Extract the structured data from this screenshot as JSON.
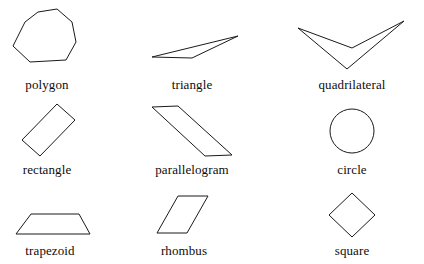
{
  "figure": {
    "background_color": "#ffffff",
    "stroke_color": "#1a1a1a",
    "label_color": "#0d0d0d",
    "rows": 3,
    "columns": 3
  },
  "shapes": [
    {
      "name": "polygon",
      "label": "polygon",
      "type": "heptagon",
      "points": "25,22 38,12 57,9 72,22 76,42 66,60 30,62 13,46",
      "label_x": 47,
      "label_y": 78
    },
    {
      "name": "triangle",
      "label": "triangle",
      "type": "triangle",
      "points": "152,57 238,36 192,58",
      "label_x": 192,
      "label_y": 78
    },
    {
      "name": "quadrilateral",
      "label": "quadrilateral",
      "type": "concave-dart",
      "points": "298,28 352,48 404,21 347,69",
      "label_x": 352,
      "label_y": 78
    },
    {
      "name": "rectangle",
      "label": "rectangle",
      "type": "rectangle",
      "points": "22,140 57,104 75,120 40,156",
      "label_x": 47,
      "label_y": 163
    },
    {
      "name": "parallelogram",
      "label": "parallelogram",
      "type": "parallelogram",
      "points": "152,107 178,106 232,155 205,156",
      "label_x": 192,
      "label_y": 163
    },
    {
      "name": "circle",
      "label": "circle",
      "type": "circle",
      "cx": 352,
      "cy": 131,
      "rx": 22,
      "ry": 22,
      "label_x": 352,
      "label_y": 163
    },
    {
      "name": "trapezoid",
      "label": "trapezoid",
      "type": "trapezoid",
      "points": "31,214 79,214 90,234 16,234",
      "label_x": 50,
      "label_y": 244
    },
    {
      "name": "rhombus",
      "label": "rhombus",
      "type": "rhombus",
      "points": "178,196 208,196 187,233 157,233",
      "label_x": 184,
      "label_y": 244
    },
    {
      "name": "square",
      "label": "square",
      "type": "square-rotated",
      "points": "352,193 375,215 352,237 329,215",
      "label_x": 352,
      "label_y": 244
    }
  ]
}
